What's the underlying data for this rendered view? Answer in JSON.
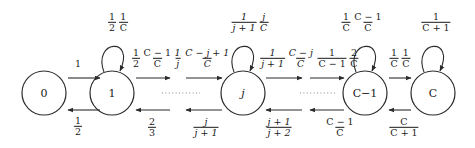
{
  "diagram": {
    "type": "markov-chain-state-diagram",
    "title": "",
    "stroke_color": "#2b2b2b",
    "text_color": "#1a1a1a",
    "dots_color": "#8a8a8a",
    "nodes": [
      {
        "id": "s0",
        "label": "0",
        "cx": 44,
        "cy": 93,
        "r": 22
      },
      {
        "id": "s1",
        "label": "1",
        "cx": 112,
        "cy": 93,
        "r": 22
      },
      {
        "id": "sj",
        "label": "j",
        "cx": 243,
        "cy": 93,
        "r": 22
      },
      {
        "id": "sCm1",
        "label": "C−1",
        "cx": 365,
        "cy": 93,
        "r": 22
      },
      {
        "id": "sC",
        "label": "C",
        "cx": 433,
        "cy": 93,
        "r": 22
      }
    ],
    "ellipses": [
      {
        "id": "gap-left",
        "cx": 178,
        "cy": 93
      },
      {
        "id": "gap-right",
        "cx": 320,
        "cy": 93
      }
    ],
    "labels": {
      "zero_to_one": {
        "text": "1",
        "x": 78,
        "y": 64
      },
      "one_to_zero": {
        "num": "1",
        "den": "2",
        "x": 78,
        "y": 124
      },
      "one_self_loop_a_num": "1",
      "one_self_loop_a_den": "2",
      "one_self_loop_b_num": "1",
      "one_self_loop_b_den": "C",
      "one_self_loop": {
        "x": 118,
        "y": 22
      },
      "one_to_right_a_num": "1",
      "one_to_right_a_den": "2",
      "one_to_right_b_num": "C − 1",
      "one_to_right_b_den": "C",
      "one_to_right": {
        "x": 150,
        "y": 58
      },
      "right_to_one": {
        "num": "2",
        "den": "3",
        "x": 152,
        "y": 126
      },
      "j_self_loop_a_num": "1",
      "j_self_loop_a_den": "j + 1",
      "j_self_loop_b_num": "j",
      "j_self_loop_b_den": "C",
      "j_self_loop": {
        "x": 248,
        "y": 22
      },
      "to_j_a_num": "1",
      "to_j_a_den": "j",
      "to_j_b_num": "C − j + 1",
      "to_j_b_den": "C",
      "to_j": {
        "x": 200,
        "y": 58
      },
      "from_j_a_num": "1",
      "from_j_a_den": "j + 1",
      "from_j_b_num": "C − j",
      "from_j_b_den": "C",
      "from_j": {
        "x": 287,
        "y": 58
      },
      "j_back": {
        "num": "j",
        "den": "j + 1",
        "x": 207,
        "y": 126
      },
      "into_j_back": {
        "num": "j + 1",
        "den": "j + 2",
        "x": 278,
        "y": 126
      },
      "cm1_self_loop_a_num": "1",
      "cm1_self_loop_a_den": "C",
      "cm1_self_loop_b_num": "C − 1",
      "cm1_self_loop_b_den": "C",
      "cm1_self_loop": {
        "x": 362,
        "y": 22
      },
      "to_cm1_a_num": "1",
      "to_cm1_a_den": "C − 1",
      "to_cm1_b_num": "2",
      "to_cm1_b_den": "C",
      "to_cm1": {
        "x": 338,
        "y": 58
      },
      "cm1_to_c_a_num": "1",
      "cm1_to_c_a_den": "C",
      "cm1_to_c_b_num": "1",
      "cm1_to_c_b_den": "C",
      "cm1_to_c": {
        "x": 400,
        "y": 58
      },
      "c_self_loop": {
        "num": "1",
        "den": "C + 1",
        "x": 435,
        "y": 22
      },
      "cm1_back": {
        "num": "C − 1",
        "den": "C",
        "x": 340,
        "y": 126
      },
      "c_back": {
        "num": "C",
        "den": "C + 1",
        "x": 404,
        "y": 126
      }
    }
  }
}
